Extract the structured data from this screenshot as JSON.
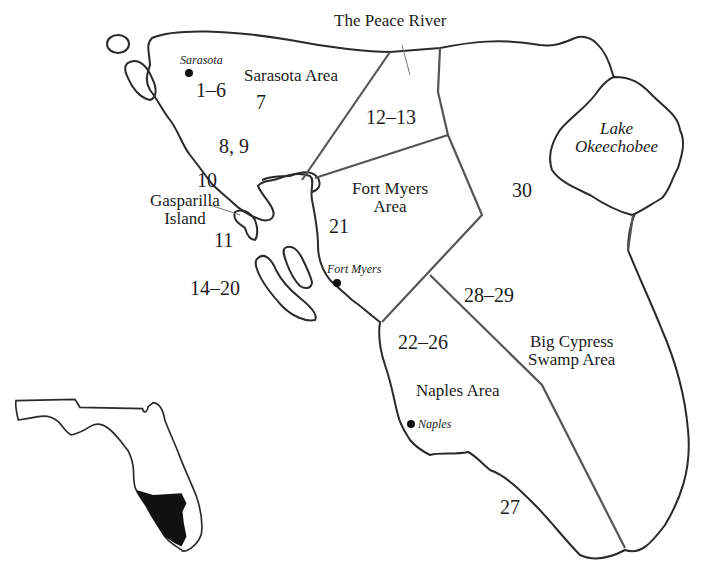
{
  "map": {
    "title": "Southwest Florida regions",
    "colors": {
      "outline": "#2a2a2a",
      "boundary": "#555555",
      "inset_fill": "#111111",
      "background": "#ffffff"
    },
    "regions": [
      {
        "name": "Sarasota Area",
        "label": "Sarasota Area"
      },
      {
        "name": "The Peace River",
        "label": "The Peace River"
      },
      {
        "name": "Fort Myers Area",
        "line1": "Fort Myers",
        "line2": "Area"
      },
      {
        "name": "Naples Area",
        "label": "Naples Area"
      },
      {
        "name": "Big Cypress Swamp Area",
        "line1": "Big Cypress",
        "line2": "Swamp Area"
      }
    ],
    "lake": {
      "line1": "Lake",
      "line2": "Okeechobee"
    },
    "island": {
      "line1": "Gasparilla",
      "line2": "Island"
    },
    "cities": [
      {
        "name": "Sarasota"
      },
      {
        "name": "Fort Myers"
      },
      {
        "name": "Naples"
      }
    ],
    "numbers": [
      "1–6",
      "7",
      "8, 9",
      "10",
      "11",
      "12–13",
      "14–20",
      "21",
      "22–26",
      "27",
      "28–29",
      "30"
    ],
    "inset": {
      "label": "Florida locator map"
    }
  }
}
